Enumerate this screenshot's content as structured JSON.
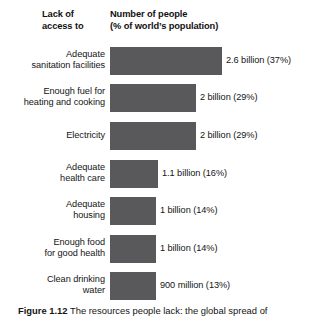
{
  "header": {
    "left_line1": "Lack of",
    "left_line2": "access to",
    "right_line1": "Number of people",
    "right_line2": "(% of world’s population)"
  },
  "caption": {
    "figure_number": "Figure 1.12",
    "text": "The resources people lack: the global spread of"
  },
  "colors": {
    "bar": "#59595B",
    "background": "#FFFFFF",
    "text": "#141414"
  },
  "chart_data": {
    "type": "bar",
    "orientation": "horizontal",
    "title": "Number of people (% of world’s population)",
    "xlabel": "Number of people (% of world’s population)",
    "ylabel": "Lack of access to",
    "grid": false,
    "legend": null,
    "unit": "billions of people",
    "categories": [
      "Adequate sanitation facilities",
      "Enough fuel for heating and cooking",
      "Electricity",
      "Adequate health care",
      "Adequate housing",
      "Enough food for good health",
      "Clean drinking water"
    ],
    "category_lines": [
      [
        "Adequate",
        "sanitation facilities"
      ],
      [
        "Enough fuel for",
        "heating and cooking"
      ],
      [
        "Electricity"
      ],
      [
        "Adequate",
        "health care"
      ],
      [
        "Adequate",
        "housing"
      ],
      [
        "Enough food",
        "for good health"
      ],
      [
        "Clean drinking",
        "water"
      ]
    ],
    "values": [
      2.6,
      2,
      2,
      1.1,
      1,
      1,
      0.9
    ],
    "percent": [
      37,
      29,
      29,
      16,
      14,
      14,
      13
    ],
    "value_labels": [
      "2.6 billion (37%)",
      "2 billion (29%)",
      "2 billion (29%)",
      "1.1 billion (16%)",
      "1 billion (14%)",
      "1 billion (14%)",
      "900 million (13%)"
    ],
    "bar_pixel_widths": [
      112,
      86,
      86,
      48,
      46,
      46,
      46
    ],
    "row_tops": [
      47,
      84,
      122,
      160,
      197,
      235,
      272
    ],
    "label_x": [
      226,
      200,
      200,
      162,
      160,
      160,
      160
    ],
    "xlim": [
      0,
      3
    ]
  }
}
